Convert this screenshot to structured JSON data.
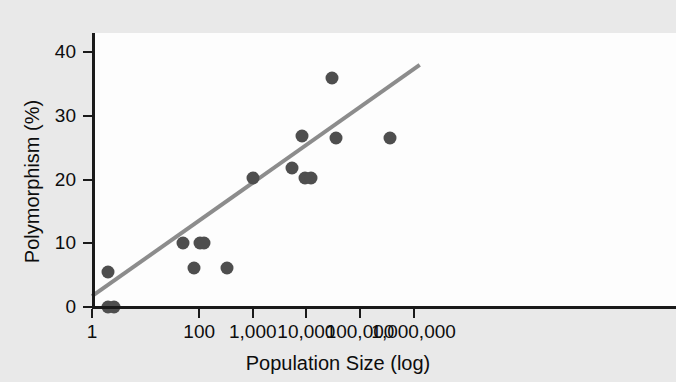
{
  "chart_data": {
    "type": "scatter",
    "title": "",
    "xlabel": "Population Size (log)",
    "ylabel": "Polymorphism (%)",
    "x_scale": "log",
    "xlim": [
      1,
      1000000
    ],
    "ylim": [
      0,
      43
    ],
    "grid": false,
    "legend": false,
    "x_ticks": [
      {
        "value": 1,
        "label": "1"
      },
      {
        "value": 100,
        "label": "100"
      },
      {
        "value": 1000,
        "label": "1,000"
      },
      {
        "value": 10000,
        "label": "10,000"
      },
      {
        "value": 100000,
        "label": "100,000"
      },
      {
        "value": 1000000,
        "label": "1,000,000"
      }
    ],
    "y_ticks": [
      {
        "value": 0,
        "label": "0"
      },
      {
        "value": 10,
        "label": "10"
      },
      {
        "value": 20,
        "label": "20"
      },
      {
        "value": 30,
        "label": "30"
      },
      {
        "value": 40,
        "label": "40"
      }
    ],
    "points": [
      {
        "x": 2,
        "y": 5.5
      },
      {
        "x": 2,
        "y": 0
      },
      {
        "x": 2.6,
        "y": 0
      },
      {
        "x": 50,
        "y": 10.0
      },
      {
        "x": 80,
        "y": 6.2
      },
      {
        "x": 105,
        "y": 10.0
      },
      {
        "x": 125,
        "y": 10.0
      },
      {
        "x": 330,
        "y": 6.2
      },
      {
        "x": 1000,
        "y": 20.3
      },
      {
        "x": 5500,
        "y": 21.8
      },
      {
        "x": 8200,
        "y": 26.8
      },
      {
        "x": 9500,
        "y": 20.3
      },
      {
        "x": 12000,
        "y": 20.3
      },
      {
        "x": 30000,
        "y": 36.0
      },
      {
        "x": 36000,
        "y": 26.5
      },
      {
        "x": 360000,
        "y": 26.5
      }
    ],
    "trendline": {
      "x_start": 1,
      "y_start": 1.7,
      "x_end": 1300000,
      "y_end": 38.0,
      "color": "#8c8c8c"
    },
    "point_color": "#4e4e4e",
    "axis_color": "#1a1a1a",
    "plot_background": "#fdfdfd",
    "figure_background": "#e9e9e9"
  }
}
